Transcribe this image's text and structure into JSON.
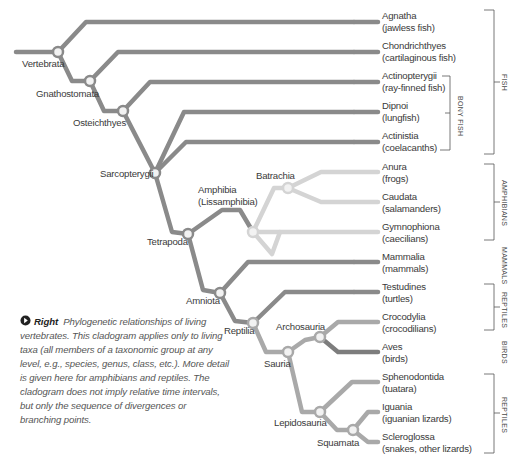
{
  "diagram": {
    "type": "cladogram",
    "colors": {
      "main_branch": "#8a8a8a",
      "amphibian_branch": "#d4d4d4",
      "reptile_branch": "#a9a9a9",
      "bird_branch": "#7d7d7d",
      "node_fill": "#ffffff",
      "bracket": "#555555"
    },
    "taxa": [
      {
        "name": "Agnatha",
        "common": "(jawless fish)"
      },
      {
        "name": "Chondrichthyes",
        "common": "(cartilaginous fish)"
      },
      {
        "name": "Actinopterygii",
        "common": "(ray-finned fish)"
      },
      {
        "name": "Dipnoi",
        "common": "(lungfish)"
      },
      {
        "name": "Actinistia",
        "common": "(coelacanths)"
      },
      {
        "name": "Anura",
        "common": "(frogs)"
      },
      {
        "name": "Caudata",
        "common": "(salamanders)"
      },
      {
        "name": "Gymnophiona",
        "common": "(caecilians)"
      },
      {
        "name": "Mammalia",
        "common": "(mammals)"
      },
      {
        "name": "Testudines",
        "common": "(turtles)"
      },
      {
        "name": "Crocodylia",
        "common": "(crocodilians)"
      },
      {
        "name": "Aves",
        "common": "(birds)"
      },
      {
        "name": "Sphenodontida",
        "common": "(tuatara)"
      },
      {
        "name": "Iguania",
        "common": "(iguanian lizards)"
      },
      {
        "name": "Scleroglossa",
        "common": "(snakes, other lizards)"
      }
    ],
    "nodes": {
      "vertebrata": "Vertebrata",
      "gnathostomata": "Gnathostomata",
      "osteichthyes": "Osteichthyes",
      "sarcopterygii": "Sarcopterygii",
      "tetrapoda": "Tetrapoda",
      "amphibia_line1": "Amphibia",
      "amphibia_line2": "(Lissamphibia)",
      "batrachia": "Batrachia",
      "amniota": "Amniota",
      "reptilia": "Reptilia",
      "sauria": "Sauria",
      "archosauria": "Archosauria",
      "lepidosauria": "Lepidosauria",
      "squamata": "Squamata"
    },
    "groups": {
      "fish": "FISH",
      "bony_fish": "BONY FISH",
      "amphibians": "AMPHIBIANS",
      "mammals": "MAMMALS",
      "reptiles_1": "REPTILES",
      "birds": "BIRDS",
      "reptiles_2": "REPTILES"
    }
  },
  "caption": {
    "lead": "Right",
    "text": "Phylogenetic relationships of living vertebrates. This cladogram applies only to living taxa (all members of a taxonomic group at any level, e.g., species, genus, class, etc.). More detail is given here for amphibians and reptiles. The cladogram does not imply relative time intervals, but only the sequence of divergences or branching points."
  }
}
